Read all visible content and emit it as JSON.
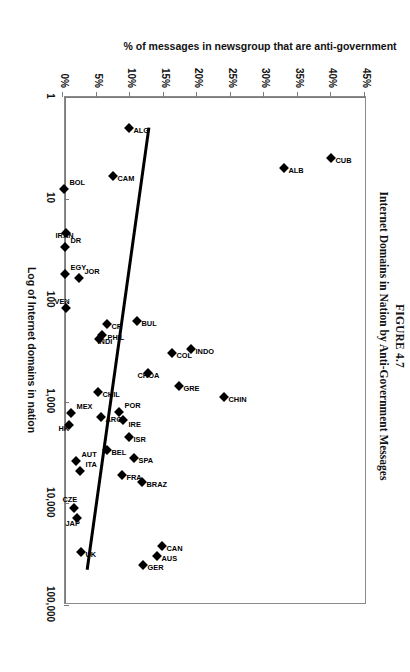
{
  "figure": {
    "number": "FIGURE 4.7",
    "title": "Internet Domains in Nation by Anti-Government Messages"
  },
  "chart_data": {
    "type": "scatter",
    "title": "Internet Domains in Nation by Anti-Government Messages",
    "xlabel": "Log of Internet domains in nation",
    "ylabel": "% of messages in newsgroup that are anti-government",
    "xscale": "log",
    "xlim": [
      1,
      100000
    ],
    "ylim": [
      0,
      45
    ],
    "grid": false,
    "legend": "none",
    "xticklabels": [
      "1",
      "10",
      "100",
      "1,000",
      "10,000",
      "100,000"
    ],
    "xtickvalues": [
      1,
      10,
      100,
      1000,
      10000,
      100000
    ],
    "yticklabels": [
      "0%",
      "5%",
      "10%",
      "15%",
      "20%",
      "25%",
      "30%",
      "35%",
      "40%",
      "45%"
    ],
    "ytickvalues": [
      0,
      5,
      10,
      15,
      20,
      25,
      30,
      35,
      40,
      45
    ],
    "points": [
      {
        "label": "CUB",
        "x": 4,
        "y": 40.0,
        "lx": 7,
        "ly": -9
      },
      {
        "label": "ALB",
        "x": 5,
        "y": 33.0,
        "lx": 7,
        "ly": -9
      },
      {
        "label": "CHIN",
        "x": 900,
        "y": 24.0,
        "lx": 7,
        "ly": -9
      },
      {
        "label": "INDO",
        "x": 300,
        "y": 19.0,
        "lx": 7,
        "ly": -9
      },
      {
        "label": "COL",
        "x": 330,
        "y": 16.3,
        "lx": 7,
        "ly": -9
      },
      {
        "label": "GRE",
        "x": 700,
        "y": 17.3,
        "lx": 7,
        "ly": -9
      },
      {
        "label": "BUL",
        "x": 160,
        "y": 11.0,
        "lx": 7,
        "ly": -9
      },
      {
        "label": "ALG",
        "x": 2,
        "y": 9.8,
        "lx": 7,
        "ly": -9
      },
      {
        "label": "CAM",
        "x": 6,
        "y": 7.4,
        "lx": 7,
        "ly": -9
      },
      {
        "label": "CR",
        "x": 170,
        "y": 6.6,
        "lx": 7,
        "ly": -9
      },
      {
        "label": "PHIL",
        "x": 220,
        "y": 5.8,
        "lx": 7,
        "ly": -10
      },
      {
        "label": "INDI",
        "x": 240,
        "y": 5.4,
        "lx": 7,
        "ly": -3
      },
      {
        "label": "CROA",
        "x": 520,
        "y": 12.6,
        "lx": 7,
        "ly": 6
      },
      {
        "label": "POR",
        "x": 1250,
        "y": 8.4,
        "lx": -2,
        "ly": -10
      },
      {
        "label": "IRE",
        "x": 1500,
        "y": 9.0,
        "lx": 9,
        "ly": -10
      },
      {
        "label": "ISR",
        "x": 2200,
        "y": 9.8,
        "lx": 7,
        "ly": -9
      },
      {
        "label": "SPA",
        "x": 3600,
        "y": 10.6,
        "lx": 7,
        "ly": -9
      },
      {
        "label": "BRAZ",
        "x": 6200,
        "y": 11.8,
        "lx": 7,
        "ly": -9
      },
      {
        "label": "CHIL",
        "x": 800,
        "y": 5.2,
        "lx": 7,
        "ly": -9
      },
      {
        "label": "ARG",
        "x": 1400,
        "y": 5.6,
        "lx": 7,
        "ly": -9
      },
      {
        "label": "BEL",
        "x": 3000,
        "y": 6.6,
        "lx": 7,
        "ly": -9
      },
      {
        "label": "FRA",
        "x": 5200,
        "y": 8.8,
        "lx": 7,
        "ly": -9
      },
      {
        "label": "CAN",
        "x": 26000,
        "y": 14.8,
        "lx": 7,
        "ly": -9
      },
      {
        "label": "AUS",
        "x": 33000,
        "y": 14.0,
        "lx": 7,
        "ly": -9
      },
      {
        "label": "GER",
        "x": 40000,
        "y": 11.9,
        "lx": 7,
        "ly": -9
      },
      {
        "label": "BOL",
        "x": 8,
        "y": 0.2,
        "lx": -2,
        "ly": -10
      },
      {
        "label": "IRAN",
        "x": 22,
        "y": 0.5,
        "lx": 7,
        "ly": 6
      },
      {
        "label": "DR",
        "x": 30,
        "y": 0.3,
        "lx": -2,
        "ly": -10
      },
      {
        "label": "EGY",
        "x": 55,
        "y": 0.3,
        "lx": -2,
        "ly": -10
      },
      {
        "label": "JOR",
        "x": 60,
        "y": 2.4,
        "lx": -2,
        "ly": -10
      },
      {
        "label": "VEN",
        "x": 120,
        "y": 0.4,
        "lx": -2,
        "ly": 7
      },
      {
        "label": "MEX",
        "x": 1300,
        "y": 1.2,
        "lx": -2,
        "ly": -10
      },
      {
        "label": "HK",
        "x": 1700,
        "y": 0.9,
        "lx": 8,
        "ly": 6
      },
      {
        "label": "AUT",
        "x": 3800,
        "y": 2.0,
        "lx": -2,
        "ly": -10
      },
      {
        "label": "ITA",
        "x": 4800,
        "y": 2.6,
        "lx": -2,
        "ly": -10
      },
      {
        "label": "CZE",
        "x": 11000,
        "y": 1.6,
        "lx": -4,
        "ly": 7
      },
      {
        "label": "JAP",
        "x": 14000,
        "y": 2.1,
        "lx": 10,
        "ly": 7
      },
      {
        "label": "UK",
        "x": 30000,
        "y": 2.7,
        "lx": 7,
        "ly": -9
      }
    ],
    "trendline": {
      "x0": 2,
      "y0": 12.8,
      "x1": 45000,
      "y1": 3.6
    }
  }
}
